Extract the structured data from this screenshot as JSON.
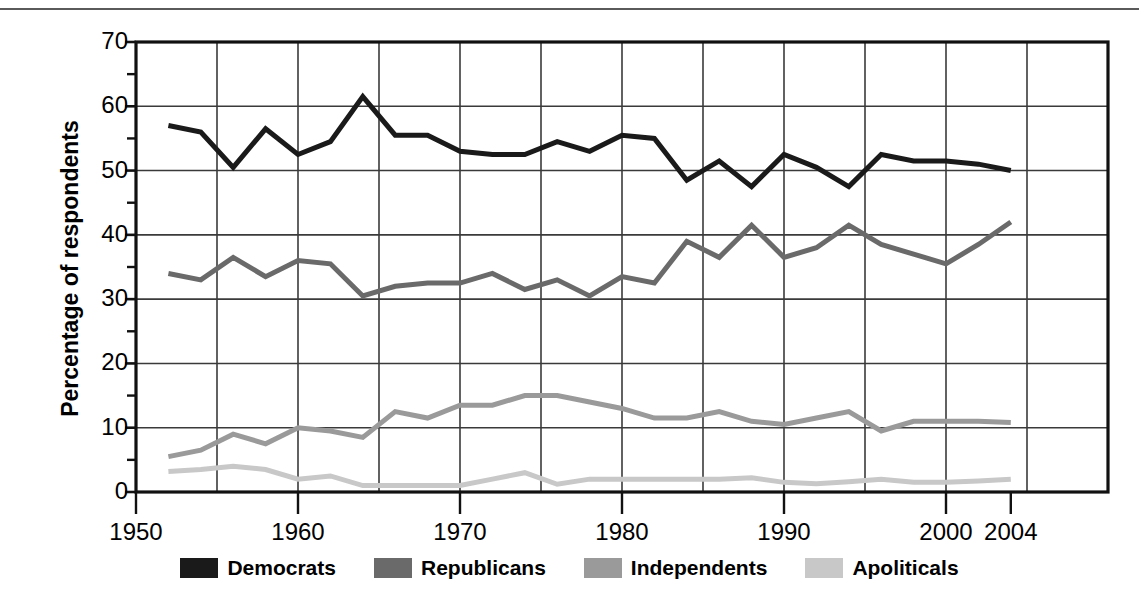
{
  "chart_data": {
    "type": "line",
    "title": "",
    "xlabel": "",
    "ylabel": "Percentage of respondents",
    "xlim": [
      1950,
      2010
    ],
    "ylim": [
      0,
      70
    ],
    "xtick_values": [
      1950,
      1960,
      1970,
      1980,
      1990,
      2000,
      2004
    ],
    "xtick_labels": [
      "1950",
      "1960",
      "1970",
      "1980",
      "1990",
      "2000",
      "2004"
    ],
    "ytick_values": [
      0,
      10,
      20,
      30,
      40,
      50,
      60,
      70
    ],
    "ytick_labels": [
      "0",
      "10",
      "20",
      "30",
      "40",
      "50",
      "60",
      "70"
    ],
    "minor_ytick_values": [
      5,
      15,
      25,
      35,
      45,
      55,
      65
    ],
    "grid": "major x every 5 years, major y every 10",
    "gridlines_x": [
      1955,
      1960,
      1965,
      1970,
      1975,
      1980,
      1985,
      1990,
      1995,
      2000,
      2005
    ],
    "gridlines_y": [
      10,
      20,
      30,
      40,
      50,
      60
    ],
    "legend_position": "below-axis-center",
    "x": [
      1952,
      1954,
      1956,
      1958,
      1960,
      1962,
      1964,
      1966,
      1968,
      1970,
      1972,
      1974,
      1976,
      1978,
      1980,
      1982,
      1984,
      1986,
      1988,
      1990,
      1992,
      1994,
      1996,
      1998,
      2000,
      2002,
      2004
    ],
    "series": [
      {
        "name": "Democrats",
        "color": "#1a1a1a",
        "width": 5,
        "values": [
          57.0,
          56.0,
          50.5,
          56.5,
          52.5,
          54.5,
          61.5,
          55.5,
          55.5,
          53.0,
          52.5,
          52.5,
          54.5,
          53.0,
          55.5,
          55.0,
          48.5,
          51.5,
          47.5,
          52.5,
          50.5,
          47.5,
          52.5,
          51.5,
          51.5,
          51.0,
          50.0
        ]
      },
      {
        "name": "Republicans",
        "color": "#6a6a6a",
        "width": 5,
        "values": [
          34.0,
          33.0,
          36.5,
          33.5,
          36.0,
          35.5,
          30.5,
          32.0,
          32.5,
          32.5,
          34.0,
          31.5,
          33.0,
          30.5,
          33.5,
          32.5,
          39.0,
          36.5,
          41.5,
          36.5,
          38.0,
          41.5,
          38.5,
          37.0,
          35.5,
          38.5,
          42.0
        ]
      },
      {
        "name": "Independents",
        "color": "#9a9a9a",
        "width": 5,
        "values": [
          5.5,
          6.5,
          9.0,
          7.5,
          10.0,
          9.5,
          8.5,
          12.5,
          11.5,
          13.5,
          13.5,
          15.0,
          15.0,
          14.0,
          13.0,
          11.5,
          11.5,
          12.5,
          11.0,
          10.5,
          11.5,
          12.5,
          9.5,
          11.0,
          11.0,
          11.0,
          10.8
        ]
      },
      {
        "name": "Apoliticals",
        "color": "#c8c8c8",
        "width": 5,
        "values": [
          3.2,
          3.5,
          4.0,
          3.5,
          2.0,
          2.5,
          1.0,
          1.0,
          1.0,
          1.0,
          2.0,
          3.0,
          1.2,
          2.0,
          2.0,
          2.0,
          2.0,
          2.0,
          2.2,
          1.5,
          1.3,
          1.6,
          2.0,
          1.5,
          1.5,
          1.7,
          2.0
        ]
      }
    ]
  },
  "axis": {
    "ylabel": "Percentage of respondents"
  },
  "legend": {
    "items": [
      {
        "label": "Democrats",
        "color": "#1a1a1a"
      },
      {
        "label": "Republicans",
        "color": "#6a6a6a"
      },
      {
        "label": "Independents",
        "color": "#9a9a9a"
      },
      {
        "label": "Apoliticals",
        "color": "#c8c8c8"
      }
    ]
  }
}
